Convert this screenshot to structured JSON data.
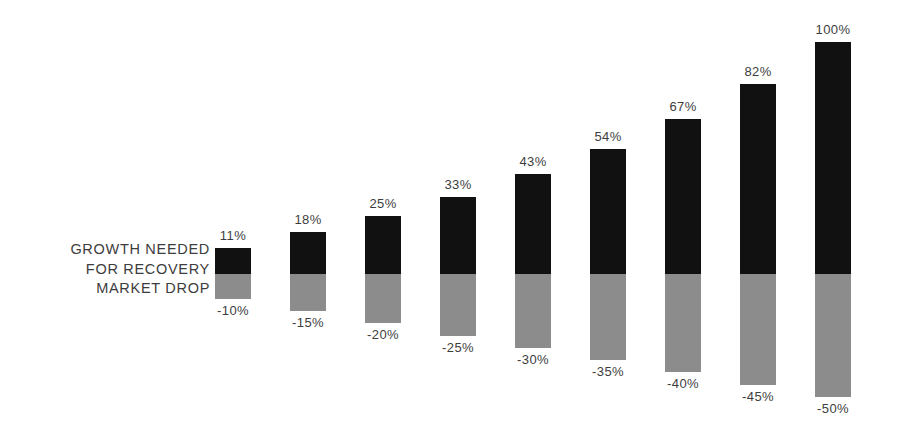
{
  "legend": {
    "lines": [
      "GROWTH NEEDED",
      "FOR RECOVERY",
      "MARKET DROP"
    ]
  },
  "colors": {
    "growth": "#111111",
    "drop": "#8c8c8c",
    "text": "#3d3d3d",
    "background": "#ffffff"
  },
  "chart_data": {
    "type": "bar",
    "title": "",
    "subtitle": "",
    "xlabel": "",
    "ylabel": "",
    "grid": false,
    "legend_position": "left-inline",
    "orientation": "vertical",
    "stacked": true,
    "baseline": 0,
    "ylim": [
      -50,
      100
    ],
    "categories": [
      "-10%",
      "-15%",
      "-20%",
      "-25%",
      "-30%",
      "-35%",
      "-40%",
      "-45%",
      "-50%"
    ],
    "series": [
      {
        "name": "GROWTH NEEDED FOR RECOVERY",
        "color": "#111111",
        "values": [
          11,
          18,
          25,
          33,
          43,
          54,
          67,
          82,
          100
        ],
        "labels": [
          "11%",
          "18%",
          "25%",
          "33%",
          "43%",
          "54%",
          "67%",
          "82%",
          "100%"
        ]
      },
      {
        "name": "MARKET DROP",
        "color": "#8c8c8c",
        "values": [
          -10,
          -15,
          -20,
          -25,
          -30,
          -35,
          -40,
          -45,
          -50
        ],
        "labels": [
          "-10%",
          "-15%",
          "-20%",
          "-25%",
          "-30%",
          "-35%",
          "-40%",
          "-45%",
          "-50%"
        ]
      }
    ],
    "bars": [
      {
        "drop_label": "-10%",
        "growth_label": "11%",
        "drop": -10,
        "growth": 11
      },
      {
        "drop_label": "-15%",
        "growth_label": "18%",
        "drop": -15,
        "growth": 18
      },
      {
        "drop_label": "-20%",
        "growth_label": "25%",
        "drop": -20,
        "growth": 25
      },
      {
        "drop_label": "-25%",
        "growth_label": "33%",
        "drop": -25,
        "growth": 33
      },
      {
        "drop_label": "-30%",
        "growth_label": "43%",
        "drop": -30,
        "growth": 43
      },
      {
        "drop_label": "-35%",
        "growth_label": "54%",
        "drop": -35,
        "growth": 54
      },
      {
        "drop_label": "-40%",
        "growth_label": "67%",
        "drop": -40,
        "growth": 67
      },
      {
        "drop_label": "-45%",
        "growth_label": "82%",
        "drop": -45,
        "growth": 82
      },
      {
        "drop_label": "-50%",
        "growth_label": "100%",
        "drop": -50,
        "growth": 100
      }
    ]
  },
  "layout": {
    "first_bar_left": 215,
    "bar_width": 36,
    "bar_pitch": 75,
    "baseline_y": 274,
    "px_per_unit_growth": 2.32,
    "px_per_unit_drop": 2.46
  }
}
